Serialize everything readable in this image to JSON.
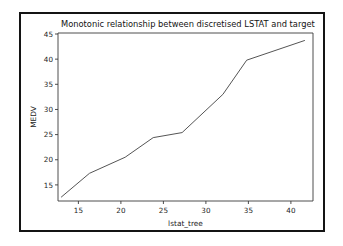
{
  "chart_data": {
    "type": "line",
    "title": "Monotonic relationship between discretised LSTAT and target",
    "xlabel": "lstat_tree",
    "ylabel": "MEDV",
    "xlim": [
      12.6,
      42.6
    ],
    "ylim": [
      11.8,
      45.2
    ],
    "xticks": [
      15,
      20,
      25,
      30,
      35,
      40
    ],
    "xtick_labels": [
      "15",
      "20",
      "25",
      "30",
      "35",
      "40"
    ],
    "yticks": [
      15,
      20,
      25,
      30,
      35,
      40,
      45
    ],
    "ytick_labels": [
      "15",
      "20",
      "25",
      "30",
      "35",
      "40",
      "45"
    ],
    "grid": false,
    "legend": null,
    "line_color": "#555555",
    "series": [
      {
        "name": "MEDV vs lstat_tree",
        "x": [
          13.0,
          16.3,
          20.5,
          23.8,
          27.2,
          32.0,
          34.8,
          41.6
        ],
        "y": [
          12.6,
          17.3,
          20.5,
          24.4,
          25.4,
          33.0,
          39.8,
          43.7
        ]
      }
    ]
  },
  "figure": {
    "border_color": "#141414",
    "background": "#ffffff"
  }
}
